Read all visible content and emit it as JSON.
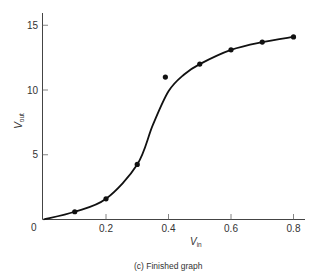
{
  "chart_data": {
    "type": "line",
    "title": "",
    "caption": "(c)  Finished graph",
    "xlabel": "V",
    "xlabel_sub": "in",
    "ylabel": "V",
    "ylabel_sub": "out",
    "xlim": [
      0,
      0.85
    ],
    "ylim": [
      0,
      16
    ],
    "grid": false,
    "legend": null,
    "x_ticks": [
      0.2,
      0.4,
      0.6,
      0.8
    ],
    "x_tick_labels": [
      "0.2",
      "0.4",
      "0.6",
      "0.8"
    ],
    "y_ticks": [
      5,
      10,
      15
    ],
    "y_tick_labels": [
      "5",
      "10",
      "15"
    ],
    "origin_label": "0",
    "series": [
      {
        "name": "measured points",
        "style": "markers",
        "x": [
          0.1,
          0.2,
          0.3,
          0.39,
          0.5,
          0.6,
          0.7,
          0.8
        ],
        "y": [
          0.6,
          1.6,
          4.25,
          11.0,
          12.0,
          13.1,
          13.7,
          14.1
        ]
      },
      {
        "name": "smooth fit curve",
        "style": "line",
        "x": [
          0.0,
          0.1,
          0.2,
          0.3,
          0.35,
          0.4,
          0.45,
          0.5,
          0.6,
          0.7,
          0.8
        ],
        "y": [
          0.0,
          0.6,
          1.6,
          4.25,
          7.3,
          9.9,
          11.2,
          12.0,
          13.1,
          13.7,
          14.1
        ]
      }
    ],
    "annotations": [
      "Point at Vin≈0.39, Vout≈11.0 lies off the fitted curve (outlier)"
    ]
  }
}
